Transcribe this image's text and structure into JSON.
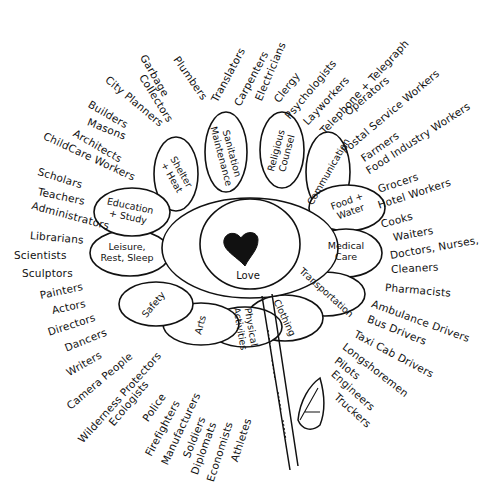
{
  "diagram": {
    "center": {
      "label": "Love",
      "icon": "heart-icon"
    },
    "petals": [
      {
        "label": "Shelter\n+ Heat",
        "x": 176,
        "y": 175,
        "rot": 60,
        "cx": 176,
        "cy": 174,
        "rx": 22,
        "ry": 37
      },
      {
        "label": "Sanitation\nMaintenance",
        "x": 226,
        "y": 155,
        "rot": 75,
        "cx": 226,
        "cy": 152,
        "rx": 21,
        "ry": 40
      },
      {
        "label": "Religious\nCounsel",
        "x": 282,
        "y": 152,
        "rot": -75,
        "cx": 282,
        "cy": 150,
        "rx": 22,
        "ry": 38
      },
      {
        "label": "Communication",
        "x": 329,
        "y": 172,
        "rot": -60,
        "cx": 328,
        "cy": 172,
        "rx": 22,
        "ry": 40
      },
      {
        "label": "Food +\nWater",
        "x": 349,
        "y": 207,
        "rot": -20,
        "cx": 347,
        "cy": 208,
        "rx": 38,
        "ry": 23
      },
      {
        "label": "Medical\nCare",
        "x": 346,
        "y": 252,
        "rot": 0,
        "cx": 346,
        "cy": 253,
        "rx": 36,
        "ry": 24
      },
      {
        "label": "Transportation",
        "x": 326,
        "y": 293,
        "rot": 42,
        "cx": 325,
        "cy": 294,
        "rx": 40,
        "ry": 22
      },
      {
        "label": "Clothing",
        "x": 284,
        "y": 318,
        "rot": 65,
        "cx": 285,
        "cy": 318,
        "rx": 38,
        "ry": 23
      },
      {
        "label": "Physical\nActivities",
        "x": 245,
        "y": 328,
        "rot": 80,
        "cx": 245,
        "cy": 327,
        "rx": 37,
        "ry": 20
      },
      {
        "label": "Arts",
        "x": 201,
        "y": 325,
        "rot": -75,
        "cx": 201,
        "cy": 324,
        "rx": 38,
        "ry": 21
      },
      {
        "label": "Safety",
        "x": 154,
        "y": 305,
        "rot": -50,
        "cx": 156,
        "cy": 304,
        "rx": 37,
        "ry": 22
      },
      {
        "label": "Leisure,\nRest, Sleep",
        "x": 127,
        "y": 253,
        "rot": 0,
        "cx": 130,
        "cy": 253,
        "rx": 40,
        "ry": 23
      },
      {
        "label": "Education\n+ Study",
        "x": 129,
        "y": 212,
        "rot": 12,
        "cx": 132,
        "cy": 212,
        "rx": 38,
        "ry": 24
      }
    ],
    "occupations": [
      {
        "label": "Garbage",
        "x": 143,
        "y": 50,
        "rot": 60
      },
      {
        "label": "Collectors",
        "x": 142,
        "y": 70,
        "rot": 58
      },
      {
        "label": "Plumbers",
        "x": 176,
        "y": 52,
        "rot": 55
      },
      {
        "label": "City Planners",
        "x": 107,
        "y": 73,
        "rot": 40
      },
      {
        "label": "Builders",
        "x": 89,
        "y": 98,
        "rot": 30
      },
      {
        "label": "Masons",
        "x": 88,
        "y": 116,
        "rot": 22
      },
      {
        "label": "Architects",
        "x": 74,
        "y": 127,
        "rot": 30
      },
      {
        "label": "ChildCare Workers",
        "x": 44,
        "y": 130,
        "rot": 25
      },
      {
        "label": "Translators",
        "x": 214,
        "y": 96,
        "rot": -62
      },
      {
        "label": "Carpenters",
        "x": 237,
        "y": 100,
        "rot": -62
      },
      {
        "label": "Electricians",
        "x": 258,
        "y": 95,
        "rot": -67
      },
      {
        "label": "Clergy",
        "x": 276,
        "y": 96,
        "rot": -52
      },
      {
        "label": "Psychologists",
        "x": 287,
        "y": 112,
        "rot": -50
      },
      {
        "label": "Layworkers",
        "x": 305,
        "y": 118,
        "rot": -47
      },
      {
        "label": "Telephone + Telegraph",
        "x": 322,
        "y": 127,
        "rot": -47
      },
      {
        "label": "Operators",
        "x": 346,
        "y": 108,
        "rot": -40
      },
      {
        "label": "Postal Service Workers",
        "x": 343,
        "y": 146,
        "rot": -40
      },
      {
        "label": "Farmers",
        "x": 362,
        "y": 154,
        "rot": -35
      },
      {
        "label": "Food Industry Workers",
        "x": 367,
        "y": 166,
        "rot": -33
      },
      {
        "label": "Scholars",
        "x": 38,
        "y": 166,
        "rot": 17
      },
      {
        "label": "Teachers",
        "x": 38,
        "y": 186,
        "rot": 12
      },
      {
        "label": "Administrators",
        "x": 32,
        "y": 200,
        "rot": 15
      },
      {
        "label": "Librarians",
        "x": 30,
        "y": 230,
        "rot": 5
      },
      {
        "label": "Scientists",
        "x": 14,
        "y": 250,
        "rot": 0
      },
      {
        "label": "Sculptors",
        "x": 22,
        "y": 268,
        "rot": 0
      },
      {
        "label": "Painters",
        "x": 40,
        "y": 290,
        "rot": -12
      },
      {
        "label": "Actors",
        "x": 52,
        "y": 305,
        "rot": -12
      },
      {
        "label": "Directors",
        "x": 48,
        "y": 327,
        "rot": -18
      },
      {
        "label": "Dancers",
        "x": 65,
        "y": 343,
        "rot": -22
      },
      {
        "label": "Writers",
        "x": 67,
        "y": 368,
        "rot": -30
      },
      {
        "label": "Camera People",
        "x": 68,
        "y": 402,
        "rot": -40
      },
      {
        "label": "Wilderness Protectors",
        "x": 80,
        "y": 436,
        "rot": -48
      },
      {
        "label": "Ecologists",
        "x": 111,
        "y": 419,
        "rot": -50
      },
      {
        "label": "Police",
        "x": 145,
        "y": 415,
        "rot": -55
      },
      {
        "label": "Firefighters",
        "x": 148,
        "y": 450,
        "rot": -62
      },
      {
        "label": "Manufacturers",
        "x": 164,
        "y": 459,
        "rot": -65
      },
      {
        "label": "Soldiers",
        "x": 186,
        "y": 452,
        "rot": -68
      },
      {
        "label": "Diplomats",
        "x": 194,
        "y": 469,
        "rot": -70
      },
      {
        "label": "Economists",
        "x": 210,
        "y": 476,
        "rot": -72
      },
      {
        "label": "Athletes",
        "x": 234,
        "y": 456,
        "rot": -72
      },
      {
        "label": "Grocers",
        "x": 378,
        "y": 184,
        "rot": -18
      },
      {
        "label": "Hotel Workers",
        "x": 378,
        "y": 200,
        "rot": -18
      },
      {
        "label": "Cooks",
        "x": 381,
        "y": 219,
        "rot": -15
      },
      {
        "label": "Waiters",
        "x": 393,
        "y": 232,
        "rot": -10
      },
      {
        "label": "Doctors, Nurses,",
        "x": 390,
        "y": 250,
        "rot": -10
      },
      {
        "label": "Cleaners",
        "x": 391,
        "y": 264,
        "rot": -3
      },
      {
        "label": "Pharmacists",
        "x": 385,
        "y": 282,
        "rot": 5
      },
      {
        "label": "Ambulance Drivers",
        "x": 372,
        "y": 298,
        "rot": 20
      },
      {
        "label": "Bus Drivers",
        "x": 368,
        "y": 313,
        "rot": 22
      },
      {
        "label": "Taxi Cab Drivers",
        "x": 355,
        "y": 328,
        "rot": 28
      },
      {
        "label": "Longshoremen",
        "x": 344,
        "y": 340,
        "rot": 38
      },
      {
        "label": "Pilots",
        "x": 336,
        "y": 354,
        "rot": 38
      },
      {
        "label": "Engineers",
        "x": 333,
        "y": 367,
        "rot": 42
      },
      {
        "label": "Truckers",
        "x": 336,
        "y": 390,
        "rot": 42
      }
    ]
  }
}
